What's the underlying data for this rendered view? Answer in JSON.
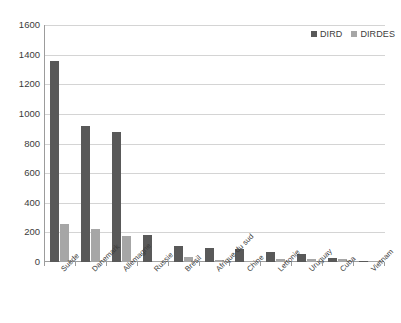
{
  "chart_data": {
    "type": "bar",
    "title": "",
    "subtitle": "",
    "xlabel": "",
    "ylabel": "",
    "ylim": [
      0,
      1600
    ],
    "ytick_step": 200,
    "yticks": [
      1600,
      1400,
      1200,
      1000,
      800,
      600,
      400,
      200,
      0
    ],
    "grid": true,
    "legend_position": "top-right",
    "categories": [
      "Suède",
      "Danemark",
      "Allemagne",
      "Russie",
      "Brésil",
      "Afrique du sud",
      "Chine",
      "Lettonie",
      "Uruguay",
      "Cuba",
      "Vietnam"
    ],
    "series": [
      {
        "name": "DIRD",
        "color": "#595959",
        "values": [
          1360,
          920,
          880,
          185,
          105,
          95,
          85,
          65,
          55,
          28,
          10
        ]
      },
      {
        "name": "DIRDES",
        "color": "#a6a6a6",
        "values": [
          255,
          225,
          175,
          5,
          32,
          15,
          10,
          22,
          18,
          17,
          5
        ]
      }
    ]
  },
  "colors": {
    "series_dird": "#595959",
    "series_dirdes": "#a6a6a6",
    "gridline": "#d4d4d4",
    "axis": "#9c9c9c",
    "text": "#3b3b3b",
    "background": "#ffffff"
  }
}
